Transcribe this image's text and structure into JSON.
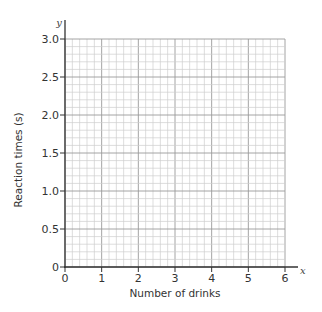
{
  "chart_data": {
    "type": "scatter",
    "title": "",
    "xlabel": "Number of drinks",
    "ylabel": "Reaction times (s)",
    "x_var": "x",
    "y_var": "y",
    "xlim": [
      0,
      6
    ],
    "ylim": [
      0,
      3.0
    ],
    "x_ticks": [
      "0",
      "1",
      "2",
      "3",
      "4",
      "5",
      "6"
    ],
    "y_ticks": [
      "0",
      "0.5",
      "1.0",
      "1.5",
      "2.0",
      "2.5",
      "3.0"
    ],
    "grid": true,
    "grid_minor_x_per_unit": 5,
    "grid_minor_y_per_half": 5,
    "series": [],
    "legend": null
  },
  "colors": {
    "axis": "#333333",
    "grid_minor": "#cfcfcf",
    "grid_major": "#9a9a9a"
  }
}
